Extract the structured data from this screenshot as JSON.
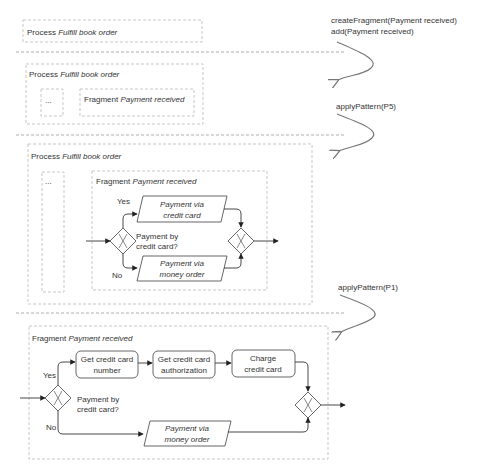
{
  "steps": {
    "step1": "createFragment(Payment received)",
    "step2": "add(Payment received)",
    "step3": "applyPattern(P5)",
    "step4": "applyPattern(P1)"
  },
  "stage1": {
    "process_prefix": "Process ",
    "process_name": "Fulfill book order"
  },
  "stage2": {
    "process_prefix": "Process ",
    "process_name": "Fulfill book order",
    "ellipsis": "...",
    "fragment_prefix": "Fragment ",
    "fragment_name": "Payment received"
  },
  "stage3": {
    "process_prefix": "Process ",
    "process_name": "Fulfill book order",
    "ellipsis": "...",
    "fragment_prefix": "Fragment ",
    "fragment_name": "Payment received",
    "gateway_label_1": "Payment by",
    "gateway_label_2": "credit card?",
    "yes": "Yes",
    "no": "No",
    "sub1_line1": "Payment via",
    "sub1_line2": "credit card",
    "sub2_line1": "Payment via",
    "sub2_line2": "money order"
  },
  "stage4": {
    "fragment_prefix": "Fragment ",
    "fragment_name": "Payment received",
    "gateway_label_1": "Payment by",
    "gateway_label_2": "credit card?",
    "yes": "Yes",
    "no": "No",
    "task1_line1": "Get credit card",
    "task1_line2": "number",
    "task2_line1": "Get credit card",
    "task2_line2": "authorization",
    "task3_line1": "Charge",
    "task3_line2": "credit card",
    "sub_line1": "Payment via",
    "sub_line2": "money order"
  },
  "colors": {
    "text": "#333333",
    "stroke": "#555555",
    "dashed_border": "#b9b9b9"
  }
}
